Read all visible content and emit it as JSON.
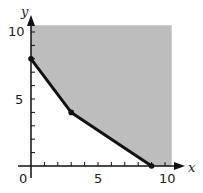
{
  "chart_data": {
    "type": "line",
    "title": "",
    "xlabel": "x",
    "ylabel": "y",
    "xlim": [
      0,
      10.5
    ],
    "ylim": [
      0,
      10.5
    ],
    "x_ticks": [
      0,
      1,
      2,
      3,
      4,
      5,
      6,
      7,
      8,
      9,
      10
    ],
    "y_ticks": [
      0,
      1,
      2,
      3,
      4,
      5,
      6,
      7,
      8,
      9,
      10
    ],
    "x_tick_labels": [
      "0",
      "5",
      "10"
    ],
    "y_tick_labels": [
      "5",
      "10"
    ],
    "origin_label": "0",
    "grid": false,
    "legend": null,
    "series": [
      {
        "name": "boundary",
        "points": [
          [
            0,
            8
          ],
          [
            3,
            4
          ],
          [
            9,
            0
          ]
        ],
        "vertex_markers": true
      }
    ],
    "shaded_region": {
      "description": "feasible region above/right of boundary, bounded by axes",
      "vertices": [
        [
          0,
          10.5
        ],
        [
          0,
          8
        ],
        [
          3,
          4
        ],
        [
          9,
          0
        ],
        [
          10.5,
          0
        ],
        [
          10.5,
          10.5
        ]
      ],
      "color": "#bdbdbd"
    }
  },
  "labels": {
    "x_axis": "x",
    "y_axis": "y",
    "origin": "0",
    "x_5": "5",
    "x_10": "10",
    "y_5": "5",
    "y_10": "10"
  }
}
